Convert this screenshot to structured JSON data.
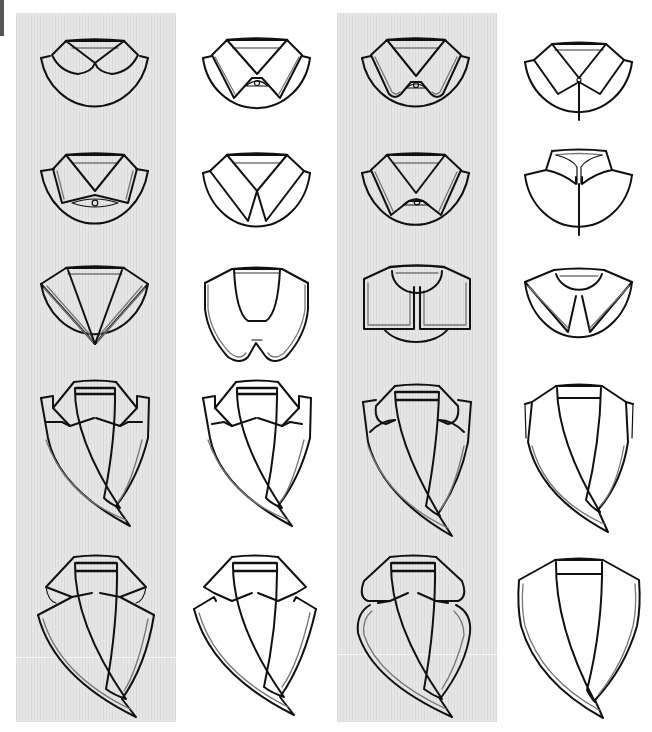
{
  "sheet": {
    "layout": {
      "rows": 5,
      "columns": 4
    },
    "background_colors": {
      "page": "#ffffff",
      "shaded_column": "#e2e2e2",
      "line": "#111111"
    },
    "shaded_columns": [
      1,
      3
    ],
    "rows": [
      {
        "row": 1,
        "items": [
          {
            "col": 1,
            "name": "peter-pan-collar-on-round-yoke"
          },
          {
            "col": 2,
            "name": "pointed-shirt-collar-with-button-on-round-yoke"
          },
          {
            "col": 3,
            "name": "rounded-tip-shirt-collar-with-button-double-stitch"
          },
          {
            "col": 4,
            "name": "pointed-shirt-collar-with-placket"
          }
        ]
      },
      {
        "row": 2,
        "items": [
          {
            "col": 1,
            "name": "wide-spread-collar-with-button-double-stitch"
          },
          {
            "col": 2,
            "name": "long-point-collar-on-round-yoke"
          },
          {
            "col": 3,
            "name": "pointed-collar-with-button-double-stitch"
          },
          {
            "col": 4,
            "name": "stand-collar-with-center-placket"
          }
        ]
      },
      {
        "row": 3,
        "items": [
          {
            "col": 1,
            "name": "sailor-v-collar-striped-trim"
          },
          {
            "col": 2,
            "name": "large-rounded-peter-pan-collar"
          },
          {
            "col": 3,
            "name": "square-cape-collar-with-trim"
          },
          {
            "col": 4,
            "name": "pointed-cape-collar"
          }
        ]
      },
      {
        "row": 4,
        "items": [
          {
            "col": 1,
            "name": "notched-lapel-double-stitch"
          },
          {
            "col": 2,
            "name": "notched-lapel-white"
          },
          {
            "col": 3,
            "name": "clover-lapel-rounded"
          },
          {
            "col": 4,
            "name": "shawl-collar"
          }
        ]
      },
      {
        "row": 5,
        "items": [
          {
            "col": 1,
            "name": "wide-peak-lapel"
          },
          {
            "col": 2,
            "name": "wide-notched-lapel-white"
          },
          {
            "col": 3,
            "name": "rounded-clover-wide-lapel"
          },
          {
            "col": 4,
            "name": "wide-shawl-collar"
          }
        ]
      }
    ]
  }
}
